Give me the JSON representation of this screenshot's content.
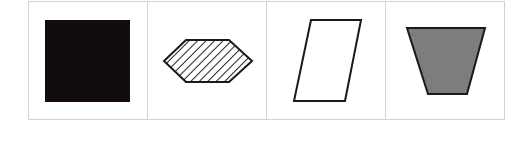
{
  "figure": {
    "panels": [
      {
        "shape": "square",
        "fill": "solid-black",
        "fill_color": "#120c0c"
      },
      {
        "shape": "hexagon",
        "fill": "diagonal-hatch",
        "fill_color": "#ffffff",
        "hatch_color": "#222222"
      },
      {
        "shape": "parallelogram",
        "fill": "none",
        "fill_color": "#ffffff"
      },
      {
        "shape": "trapezoid",
        "fill": "solid-gray",
        "fill_color": "#7d7d7d"
      }
    ],
    "border_color": "#d2d2d2",
    "stroke_color": "#1a1a1a"
  }
}
